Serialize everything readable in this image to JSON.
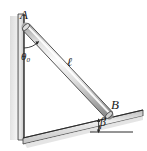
{
  "figure": {
    "background_color": "#ffffff",
    "labels": {
      "point_a": "A",
      "point_b": "B",
      "rod_length": "ℓ",
      "angle_theta": "θ",
      "angle_theta_subscript": "0",
      "angle_beta": "β"
    },
    "colors": {
      "outline": "#2b2b2b",
      "rod_light": "#fdfdfd",
      "rod_mid": "#c8c8c8",
      "rod_dark": "#8f8f8f",
      "wall_light": "#e9e9e9",
      "wall_dark": "#b0b0b0",
      "incline_light": "#efefef",
      "incline_dark": "#a8a8a8",
      "shadow": "#d6d6d6"
    },
    "geometry": {
      "wall_top": {
        "x": 23,
        "y": 14
      },
      "wall_bottom": {
        "x": 23,
        "y": 138
      },
      "rod_end_a": {
        "x": 26,
        "y": 27
      },
      "rod_end_b": {
        "x": 109,
        "y": 115
      },
      "incline_left": {
        "x": 23,
        "y": 138
      },
      "incline_right": {
        "x": 143,
        "y": 110
      },
      "reference_line_left": {
        "x": 90,
        "y": 132
      },
      "reference_line_right": {
        "x": 133,
        "y": 132
      },
      "theta_arc_radius": 21,
      "beta_arc_radius": 14
    }
  }
}
